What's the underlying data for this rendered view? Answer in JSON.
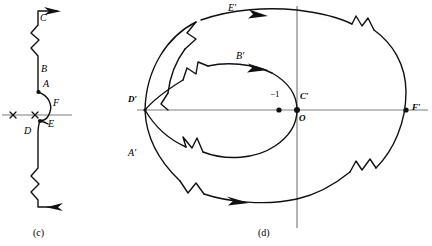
{
  "figure": {
    "stroke_color": "#111111",
    "axis_color": "#7f7f7f",
    "background": "#ffffff"
  },
  "panel_c": {
    "caption": "(c)",
    "labels": [
      {
        "key": "A",
        "text": "A",
        "x": 43,
        "y": 85
      },
      {
        "key": "B",
        "text": "B",
        "x": 41,
        "y": 71
      },
      {
        "key": "C",
        "text": "C",
        "x": 39,
        "y": 13
      },
      {
        "key": "D",
        "text": "D",
        "x": 25,
        "y": 128
      },
      {
        "key": "E",
        "text": "E",
        "x": 48,
        "y": 124
      },
      {
        "key": "F",
        "text": "F",
        "x": 53,
        "y": 103
      }
    ],
    "pole_markers": [
      {
        "key": "pole-left",
        "symbol": "x",
        "x": 13,
        "y": 115
      },
      {
        "key": "pole-origin",
        "symbol": "x",
        "x": 35,
        "y": 115
      }
    ],
    "arrows": [
      {
        "key": "top-arrow",
        "direction": "right"
      },
      {
        "key": "bottom-arrow",
        "direction": "left"
      }
    ]
  },
  "panel_d": {
    "caption": "(d)",
    "labels": [
      {
        "key": "Aprime",
        "text": "A′",
        "x": 131,
        "y": 150
      },
      {
        "key": "Bprime",
        "text": "B′",
        "x": 237,
        "y": 56
      },
      {
        "key": "Cprime",
        "text": "C′",
        "x": 300,
        "y": 96
      },
      {
        "key": "Dprime",
        "text": "D′",
        "x": 131,
        "y": 97
      },
      {
        "key": "Eprime",
        "text": "E′",
        "x": 228,
        "y": 7
      },
      {
        "key": "Fprime",
        "text": "F′",
        "x": 412,
        "y": 104
      },
      {
        "key": "O",
        "text": "O",
        "x": 299,
        "y": 119
      },
      {
        "key": "minus-one",
        "text": "−1",
        "x": 271,
        "y": 93
      }
    ],
    "points": [
      {
        "key": "point-minus-one",
        "value": "−1",
        "x": 279,
        "y": 110
      },
      {
        "key": "point-origin",
        "value": "O",
        "x": 297,
        "y": 110
      },
      {
        "key": "point-dprime",
        "value": "D′",
        "x": 145,
        "y": 110
      },
      {
        "key": "point-fprime",
        "value": "F′",
        "x": 406,
        "y": 110
      }
    ],
    "arrows": [
      {
        "key": "outer-top-arrow",
        "direction": "right"
      },
      {
        "key": "outer-bottom-arrow",
        "direction": "left"
      },
      {
        "key": "inner-top-arrow",
        "direction": "right"
      }
    ],
    "ellipses": [
      {
        "key": "outer-ellipse",
        "cx": 276,
        "cy": 110,
        "rx": 131,
        "ry": 100
      },
      {
        "key": "inner-ellipse",
        "cx": 221,
        "cy": 110,
        "rx": 76,
        "ry": 50
      }
    ]
  }
}
